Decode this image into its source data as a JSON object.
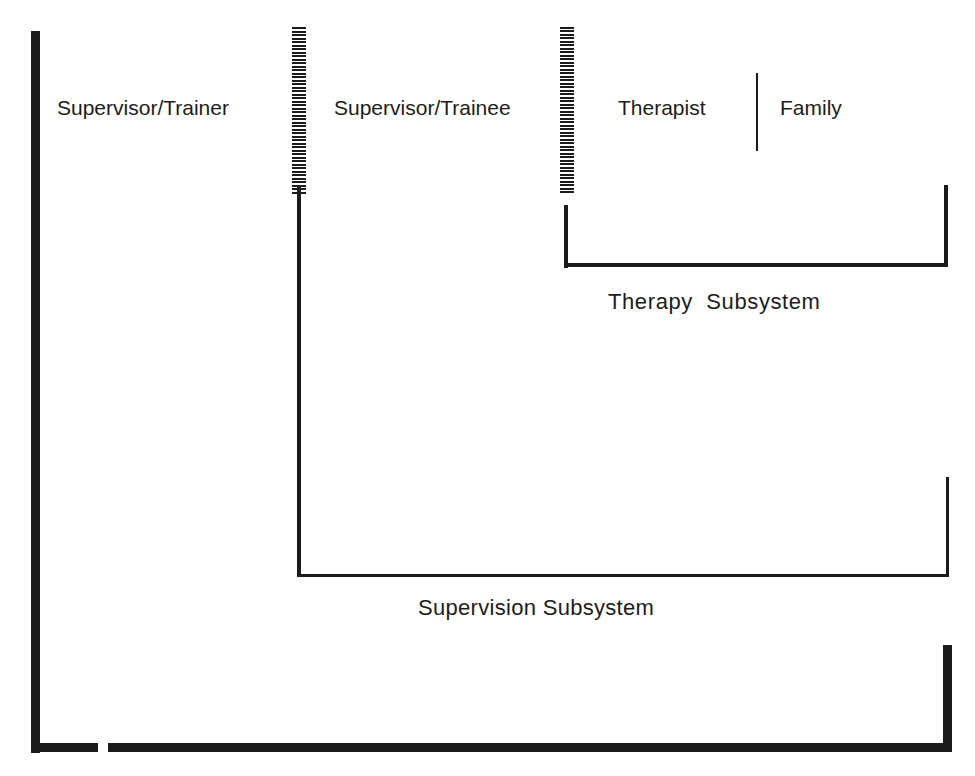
{
  "diagram": {
    "labels": {
      "supervisor_trainer": "Supervisor/Trainer",
      "supervisor_trainee": "Supervisor/Trainee",
      "therapist": "Therapist",
      "family": "Family",
      "therapy_subsystem": "Therapy  Subsystem",
      "supervision_subsystem": "Supervision Subsystem"
    },
    "boundaries": [
      {
        "name": "trainer-trainee-boundary",
        "style": "hatched"
      },
      {
        "name": "trainee-therapy-boundary",
        "style": "hatched"
      },
      {
        "name": "therapist-family-boundary",
        "style": "solid-thin"
      }
    ],
    "brackets": [
      {
        "name": "therapy-subsystem-bracket",
        "encloses": [
          "Therapist",
          "Family"
        ]
      },
      {
        "name": "supervision-subsystem-bracket",
        "encloses": [
          "Supervisor/Trainee",
          "Therapist",
          "Family"
        ]
      },
      {
        "name": "outer-system-bracket",
        "encloses": [
          "Supervisor/Trainer",
          "Supervisor/Trainee",
          "Therapist",
          "Family"
        ]
      }
    ],
    "colors": {
      "line": "#1b1b1b",
      "background": "#ffffff"
    }
  }
}
